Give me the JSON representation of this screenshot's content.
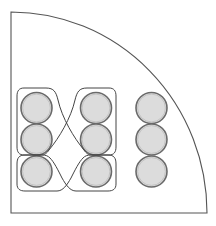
{
  "diagram": {
    "colors": {
      "background": "#ffffff",
      "boundary_stroke": "#555555",
      "circle_fill": "#dcdcdc",
      "circle_stroke": "#6a6a6a",
      "outline_stroke": "#444444"
    },
    "boundary": {
      "shape": "quarter-circle",
      "corner": [
        11,
        213
      ],
      "top": [
        11,
        12
      ],
      "right": [
        207,
        213
      ]
    },
    "circle_radius": 15.5,
    "circles": [
      {
        "column": "left",
        "row": 1,
        "cx": 36.5,
        "cy": 108
      },
      {
        "column": "left",
        "row": 2,
        "cx": 36.5,
        "cy": 139.5
      },
      {
        "column": "left",
        "row": 3,
        "cx": 36.5,
        "cy": 171.5
      },
      {
        "column": "middle",
        "row": 1,
        "cx": 96,
        "cy": 108
      },
      {
        "column": "middle",
        "row": 2,
        "cx": 96,
        "cy": 139.5
      },
      {
        "column": "middle",
        "row": 3,
        "cx": 96,
        "cy": 171.5
      },
      {
        "column": "right",
        "row": 1,
        "cx": 151.5,
        "cy": 108
      },
      {
        "column": "right",
        "row": 2,
        "cx": 151.5,
        "cy": 139.5
      },
      {
        "column": "right",
        "row": 3,
        "cx": 151.5,
        "cy": 171.5
      }
    ],
    "outlines": [
      {
        "name": "loop-left-to-middle",
        "encloses": [
          "left-1",
          "left-2",
          "middle-3"
        ]
      },
      {
        "name": "loop-middle-to-left",
        "encloses": [
          "middle-1",
          "middle-2",
          "left-3"
        ]
      }
    ]
  }
}
